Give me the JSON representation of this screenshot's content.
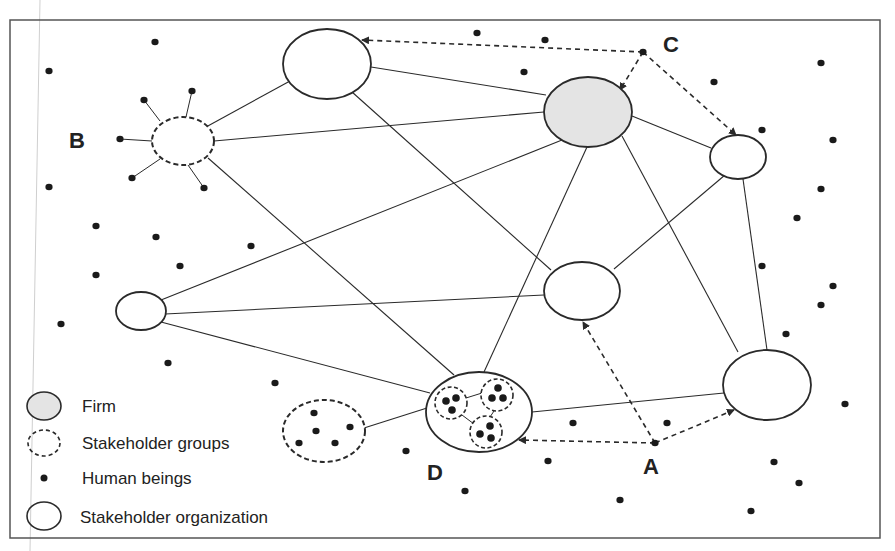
{
  "labels": {
    "A": {
      "text": "A",
      "x": 643,
      "y": 474
    },
    "B": {
      "text": "B",
      "x": 69,
      "y": 148
    },
    "C": {
      "text": "C",
      "x": 663,
      "y": 52
    },
    "D": {
      "text": "D",
      "x": 427,
      "y": 480
    }
  },
  "legend": {
    "items": [
      {
        "label": "Firm",
        "shape": "ellipse-gray-fill",
        "cx": 44,
        "cy": 406,
        "rx": 17,
        "ry": 14,
        "tx": 82,
        "ty": 412
      },
      {
        "label": "Stakeholder groups",
        "shape": "ellipse-dashed",
        "cx": 44,
        "cy": 443,
        "rx": 16,
        "ry": 13,
        "tx": 82,
        "ty": 449
      },
      {
        "label": "Human beings",
        "shape": "dot",
        "cx": 44,
        "cy": 478,
        "r": 3.5,
        "tx": 82,
        "ty": 484
      },
      {
        "label": "Stakeholder organization",
        "shape": "ellipse-solid",
        "cx": 44,
        "cy": 516,
        "rx": 17,
        "ry": 14,
        "tx": 80,
        "ty": 523
      }
    ]
  },
  "colors": {
    "stroke": "#2a2a2a",
    "firm_fill": "#e4e4e4",
    "dot": "#1a1a1a",
    "background": "#ffffff"
  },
  "frame": {
    "x": 10,
    "y": 20,
    "w": 870,
    "h": 518
  },
  "nodes": [
    {
      "id": "top",
      "type": "organization",
      "cx": 327,
      "cy": 64,
      "rx": 44,
      "ry": 35
    },
    {
      "id": "firm",
      "type": "firm",
      "cx": 588,
      "cy": 112,
      "rx": 44,
      "ry": 35
    },
    {
      "id": "right-small",
      "type": "organization",
      "cx": 738,
      "cy": 157,
      "rx": 28,
      "ry": 22
    },
    {
      "id": "B",
      "type": "group",
      "cx": 183,
      "cy": 141,
      "rx": 31,
      "ry": 24
    },
    {
      "id": "left",
      "type": "organization",
      "cx": 141,
      "cy": 311,
      "rx": 25,
      "ry": 19
    },
    {
      "id": "middle",
      "type": "organization",
      "cx": 582,
      "cy": 291,
      "rx": 38,
      "ry": 29
    },
    {
      "id": "bottom-right",
      "type": "organization",
      "cx": 767,
      "cy": 385,
      "rx": 44,
      "ry": 35
    },
    {
      "id": "D",
      "type": "organization",
      "cx": 479,
      "cy": 412,
      "rx": 53,
      "ry": 40
    },
    {
      "id": "lower-group",
      "type": "group",
      "cx": 324,
      "cy": 431,
      "rx": 41,
      "ry": 31
    }
  ],
  "inner_groups": [
    {
      "cx": 451,
      "cy": 403,
      "r": 16,
      "dots": [
        [
          446,
          401
        ],
        [
          456,
          398
        ],
        [
          452,
          410
        ]
      ]
    },
    {
      "cx": 497,
      "cy": 395,
      "r": 16,
      "dots": [
        [
          498,
          388
        ],
        [
          492,
          398
        ],
        [
          503,
          398
        ]
      ]
    },
    {
      "cx": 486,
      "cy": 432,
      "r": 16,
      "dots": [
        [
          490,
          426
        ],
        [
          480,
          434
        ],
        [
          491,
          438
        ]
      ]
    }
  ],
  "inner_links": [
    [
      [
        466,
        398
      ],
      [
        482,
        393
      ]
    ],
    [
      [
        462,
        415
      ],
      [
        474,
        424
      ]
    ],
    [
      [
        494,
        411
      ],
      [
        490,
        417
      ]
    ]
  ],
  "edges": [
    [
      [
        290,
        81
      ],
      [
        206,
        127
      ]
    ],
    [
      [
        214,
        141
      ],
      [
        544,
        112
      ]
    ],
    [
      [
        371,
        67
      ],
      [
        546,
        95
      ]
    ],
    [
      [
        352,
        92
      ],
      [
        551,
        270
      ]
    ],
    [
      [
        208,
        158
      ],
      [
        454,
        375
      ]
    ],
    [
      [
        632,
        116
      ],
      [
        711,
        148
      ]
    ],
    [
      [
        562,
        140
      ],
      [
        161,
        300
      ]
    ],
    [
      [
        165,
        314
      ],
      [
        544,
        295
      ]
    ],
    [
      [
        161,
        322
      ],
      [
        430,
        393
      ]
    ],
    [
      [
        614,
        269
      ],
      [
        725,
        175
      ]
    ],
    [
      [
        587,
        147
      ],
      [
        484,
        372
      ]
    ],
    [
      [
        622,
        136
      ],
      [
        738,
        352
      ]
    ],
    [
      [
        743,
        179
      ],
      [
        767,
        350
      ]
    ],
    [
      [
        532,
        412
      ],
      [
        724,
        393
      ]
    ],
    [
      [
        364,
        428
      ],
      [
        427,
        408
      ]
    ]
  ],
  "satellite_edges": [
    [
      [
        144,
        100
      ],
      [
        160,
        121
      ]
    ],
    [
      [
        192,
        91
      ],
      [
        186,
        117
      ]
    ],
    [
      [
        120,
        139
      ],
      [
        152,
        141
      ]
    ],
    [
      [
        132,
        178
      ],
      [
        160,
        159
      ]
    ],
    [
      [
        204,
        188
      ],
      [
        188,
        165
      ]
    ]
  ],
  "dashed_arrows": [
    {
      "from": [
        643,
        52
      ],
      "to": [
        362,
        40
      ],
      "via": null
    },
    {
      "from": [
        643,
        52
      ],
      "to": [
        620,
        90
      ],
      "via": null
    },
    {
      "from": [
        643,
        52
      ],
      "to": [
        736,
        135
      ],
      "via": null
    },
    {
      "from": [
        655,
        443
      ],
      "to": [
        583,
        322
      ],
      "via": null
    },
    {
      "from": [
        655,
        443
      ],
      "to": [
        519,
        440
      ],
      "via": null
    },
    {
      "from": [
        655,
        443
      ],
      "to": [
        734,
        410
      ],
      "via": null
    }
  ],
  "dots": [
    [
      155,
      42
    ],
    [
      49,
      71
    ],
    [
      477,
      33
    ],
    [
      545,
      40
    ],
    [
      524,
      72
    ],
    [
      714,
      82
    ],
    [
      821,
      63
    ],
    [
      144,
      100
    ],
    [
      192,
      91
    ],
    [
      120,
      139
    ],
    [
      132,
      178
    ],
    [
      204,
      188
    ],
    [
      762,
      130
    ],
    [
      833,
      140
    ],
    [
      821,
      189
    ],
    [
      797,
      218
    ],
    [
      762,
      266
    ],
    [
      833,
      286
    ],
    [
      821,
      305
    ],
    [
      786,
      334
    ],
    [
      49,
      187
    ],
    [
      96,
      226
    ],
    [
      156,
      237
    ],
    [
      251,
      246
    ],
    [
      180,
      266
    ],
    [
      96,
      275
    ],
    [
      61,
      324
    ],
    [
      168,
      363
    ],
    [
      275,
      383
    ],
    [
      406,
      451
    ],
    [
      465,
      491
    ],
    [
      573,
      423
    ],
    [
      667,
      423
    ],
    [
      548,
      461
    ],
    [
      620,
      500
    ],
    [
      845,
      404
    ],
    [
      774,
      462
    ],
    [
      799,
      483
    ],
    [
      751,
      511
    ],
    [
      314,
      413
    ],
    [
      316,
      431
    ],
    [
      299,
      443
    ],
    [
      335,
      443
    ],
    [
      350,
      427
    ],
    [
      643,
      52
    ],
    [
      655,
      443
    ]
  ]
}
